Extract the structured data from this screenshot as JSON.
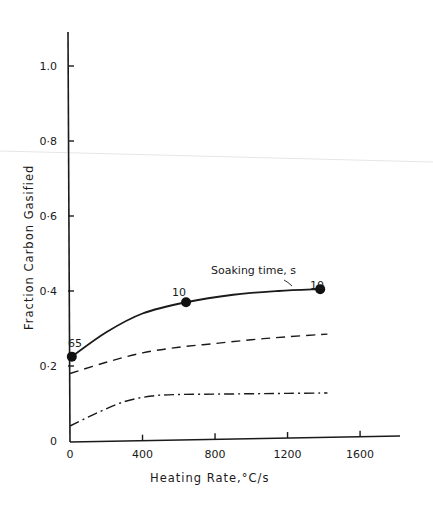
{
  "chart_data": {
    "type": "line",
    "title": "",
    "xlabel": "Heating Rate,°C/s",
    "ylabel": "Fraction  Carbon  Gasified",
    "xlim": [
      0,
      1800
    ],
    "ylim": [
      0,
      1.1
    ],
    "x_ticks": [
      0,
      400,
      800,
      1200,
      1600
    ],
    "x_tick_labels": [
      "0",
      "400",
      "800",
      "1200",
      "1600"
    ],
    "y_ticks": [
      0,
      0.2,
      0.4,
      0.6,
      0.8,
      1.0
    ],
    "y_tick_labels": [
      "0",
      "0·2",
      "0·4",
      "0·6",
      "0·8",
      "1.0"
    ],
    "grid": false,
    "legend": null,
    "series": [
      {
        "name": "solid (with markers)",
        "style": "solid",
        "x": [
          10,
          200,
          400,
          640,
          900,
          1150,
          1380
        ],
        "y": [
          0.225,
          0.29,
          0.34,
          0.37,
          0.39,
          0.4,
          0.405
        ],
        "markers": [
          {
            "x": 10,
            "y": 0.225,
            "label": "65"
          },
          {
            "x": 640,
            "y": 0.37,
            "label": "10"
          },
          {
            "x": 1380,
            "y": 0.405,
            "label": "10"
          }
        ]
      },
      {
        "name": "dashed",
        "style": "dashed",
        "x": [
          0,
          200,
          400,
          600,
          800,
          1000,
          1200,
          1420
        ],
        "y": [
          0.18,
          0.21,
          0.235,
          0.25,
          0.26,
          0.27,
          0.278,
          0.285
        ]
      },
      {
        "name": "dash-dot",
        "style": "dashdot",
        "x": [
          0,
          150,
          300,
          450,
          600,
          800,
          1000,
          1200,
          1420
        ],
        "y": [
          0.04,
          0.075,
          0.105,
          0.12,
          0.124,
          0.125,
          0.126,
          0.127,
          0.128
        ]
      }
    ],
    "annotations": [
      {
        "text": "Soaking time, s",
        "x": 1200,
        "y": 0.44
      },
      {
        "text": "65",
        "x": 20,
        "y": 0.26
      },
      {
        "text": "10",
        "x": 600,
        "y": 0.4
      },
      {
        "text": "10",
        "x": 1340,
        "y": 0.43
      }
    ]
  }
}
